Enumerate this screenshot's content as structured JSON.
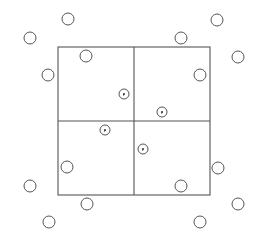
{
  "diagram": {
    "stroke_color": "#555555",
    "background": "#ffffff",
    "grid": {
      "x": 58,
      "y": 47,
      "width": 152,
      "height": 148,
      "divider_x": 134,
      "divider_y": 121
    },
    "open_circle_radius": 6,
    "dotted_circle_radius": 5,
    "outer_circles": [
      {
        "cx": 68,
        "cy": 19
      },
      {
        "cx": 30,
        "cy": 38
      },
      {
        "cx": 217,
        "cy": 20
      },
      {
        "cx": 181,
        "cy": 38
      },
      {
        "cx": 48,
        "cy": 75
      },
      {
        "cx": 238,
        "cy": 57
      },
      {
        "cx": 30,
        "cy": 186
      },
      {
        "cx": 87,
        "cy": 204
      },
      {
        "cx": 49,
        "cy": 222
      },
      {
        "cx": 218,
        "cy": 168
      },
      {
        "cx": 238,
        "cy": 204
      },
      {
        "cx": 200,
        "cy": 222
      }
    ],
    "inner_circles": [
      {
        "cx": 86,
        "cy": 56
      },
      {
        "cx": 200,
        "cy": 75
      },
      {
        "cx": 67,
        "cy": 167
      },
      {
        "cx": 181,
        "cy": 186
      }
    ],
    "dotted_circles": [
      {
        "cx": 124,
        "cy": 94
      },
      {
        "cx": 162,
        "cy": 112
      },
      {
        "cx": 105,
        "cy": 130
      },
      {
        "cx": 143,
        "cy": 149
      }
    ]
  }
}
